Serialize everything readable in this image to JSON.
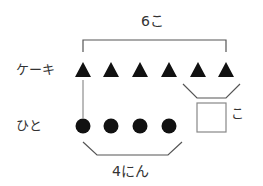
{
  "labels": {
    "total_cakes": "6こ",
    "cake_row": "ケーキ",
    "people_row": "ひと",
    "people_count": "4にん",
    "unknown_unit": "こ"
  },
  "diagram": {
    "cake_count": 6,
    "people_count": 4,
    "answer_box_value": "",
    "colors": {
      "mark": "#111111",
      "line": "#555555",
      "box": "#888888"
    }
  }
}
